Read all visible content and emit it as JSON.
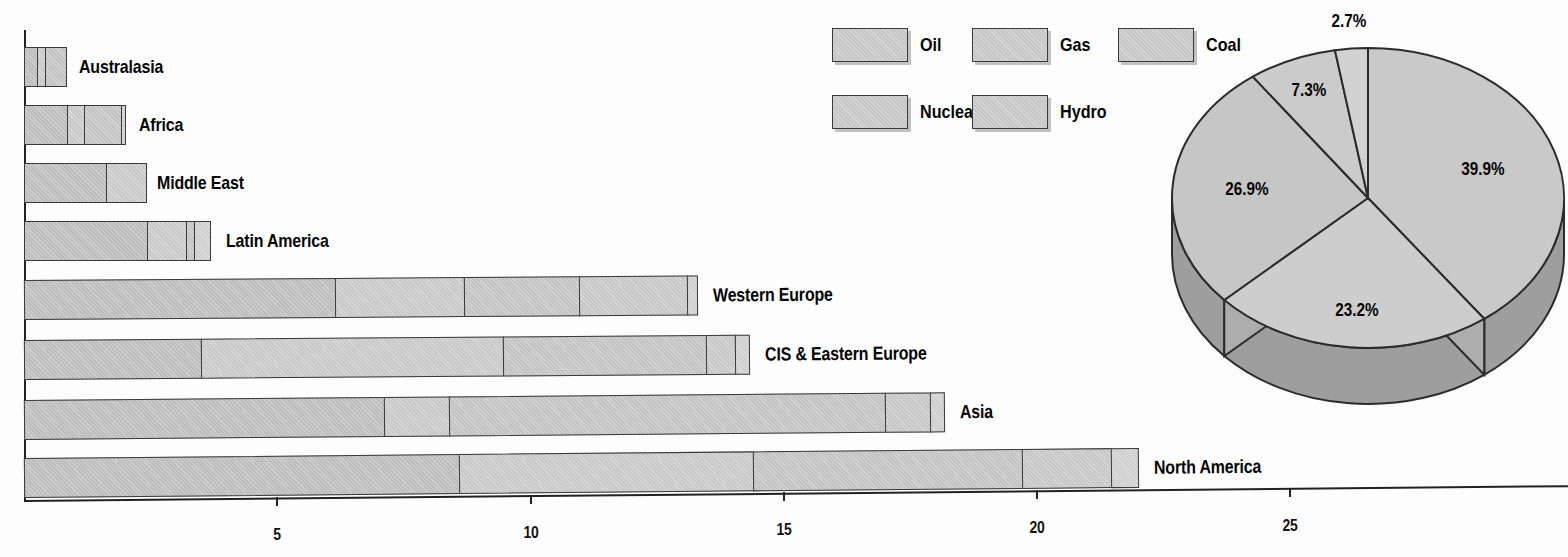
{
  "chart_data": [
    {
      "type": "bar",
      "orientation": "horizontal",
      "stacked": true,
      "title": "",
      "xlabel": "",
      "ylabel": "",
      "xlim": [
        0,
        25.8
      ],
      "xticks": [
        5,
        10,
        15,
        20,
        25
      ],
      "xticklabels": [
        "5",
        "10",
        "15",
        "20",
        "25"
      ],
      "grid": false,
      "categories": [
        "Australasia",
        "Africa",
        "Middle East",
        "Latin America",
        "Western Europe",
        "CIS & Eastern Europe",
        "Asia",
        "North America"
      ],
      "series": [
        {
          "name": "Oil",
          "values": [
            0.29,
            0.87,
            1.64,
            2.45,
            6.17,
            3.52,
            7.14,
            8.62
          ]
        },
        {
          "name": "Gas",
          "values": [
            0.18,
            0.38,
            0.81,
            0.81,
            2.57,
            5.99,
            1.32,
            5.84
          ]
        },
        {
          "name": "Coal",
          "values": [
            0.44,
            0.75,
            0.0,
            0.18,
            2.31,
            4.05,
            8.62,
            5.34
          ]
        },
        {
          "name": "Nuclear",
          "values": [
            0.0,
            0.0,
            0.0,
            0.04,
            2.16,
            0.59,
            0.93,
            1.78
          ]
        },
        {
          "name": "Hydro",
          "values": [
            0.0,
            0.1,
            0.0,
            0.34,
            0.22,
            0.3,
            0.3,
            0.55
          ]
        }
      ],
      "totals": [
        0.91,
        2.1,
        2.45,
        3.82,
        13.43,
        14.45,
        18.31,
        22.13
      ]
    },
    {
      "type": "pie",
      "title": "",
      "three_d": true,
      "labels": [
        "Oil",
        "Gas",
        "Coal",
        "Nuclear",
        "Hydro"
      ],
      "values": [
        39.9,
        23.2,
        26.9,
        7.3,
        2.7
      ],
      "datalabels": [
        "39.9%",
        "23.2%",
        "26.9%",
        "7.3%",
        "2.7%"
      ],
      "start_angle_deg": 0,
      "direction": "clockwise"
    }
  ],
  "legend": {
    "position": "top-center",
    "items": [
      {
        "label": "Oil",
        "swatch_color": "#c6c6c6"
      },
      {
        "label": "Gas",
        "swatch_color": "#c6c6c6"
      },
      {
        "label": "Coal",
        "swatch_color": "#c6c6c6"
      },
      {
        "label": "Nuclear",
        "swatch_color": "#c6c6c6"
      },
      {
        "label": "Hydro",
        "swatch_color": "#c6c6c6"
      }
    ]
  },
  "axis": {
    "ticklabels": [
      "5",
      "10",
      "15",
      "20",
      "25"
    ]
  },
  "bars": {
    "labels": [
      "Australasia",
      "Africa",
      "Middle East",
      "Latin America",
      "Western Europe",
      "CIS & Eastern Europe",
      "Asia",
      "North America"
    ]
  },
  "pie": {
    "datalabels": [
      "39.9%",
      "23.2%",
      "26.9%",
      "7.3%",
      "2.7%"
    ]
  },
  "style": {
    "bar_fill": "#c4c4c4",
    "bar_stroke": "#3a3a3a",
    "pie_top_fill": "#c8c8c8",
    "pie_side_fill": "#9e9e9e",
    "text_color": "#050505"
  }
}
